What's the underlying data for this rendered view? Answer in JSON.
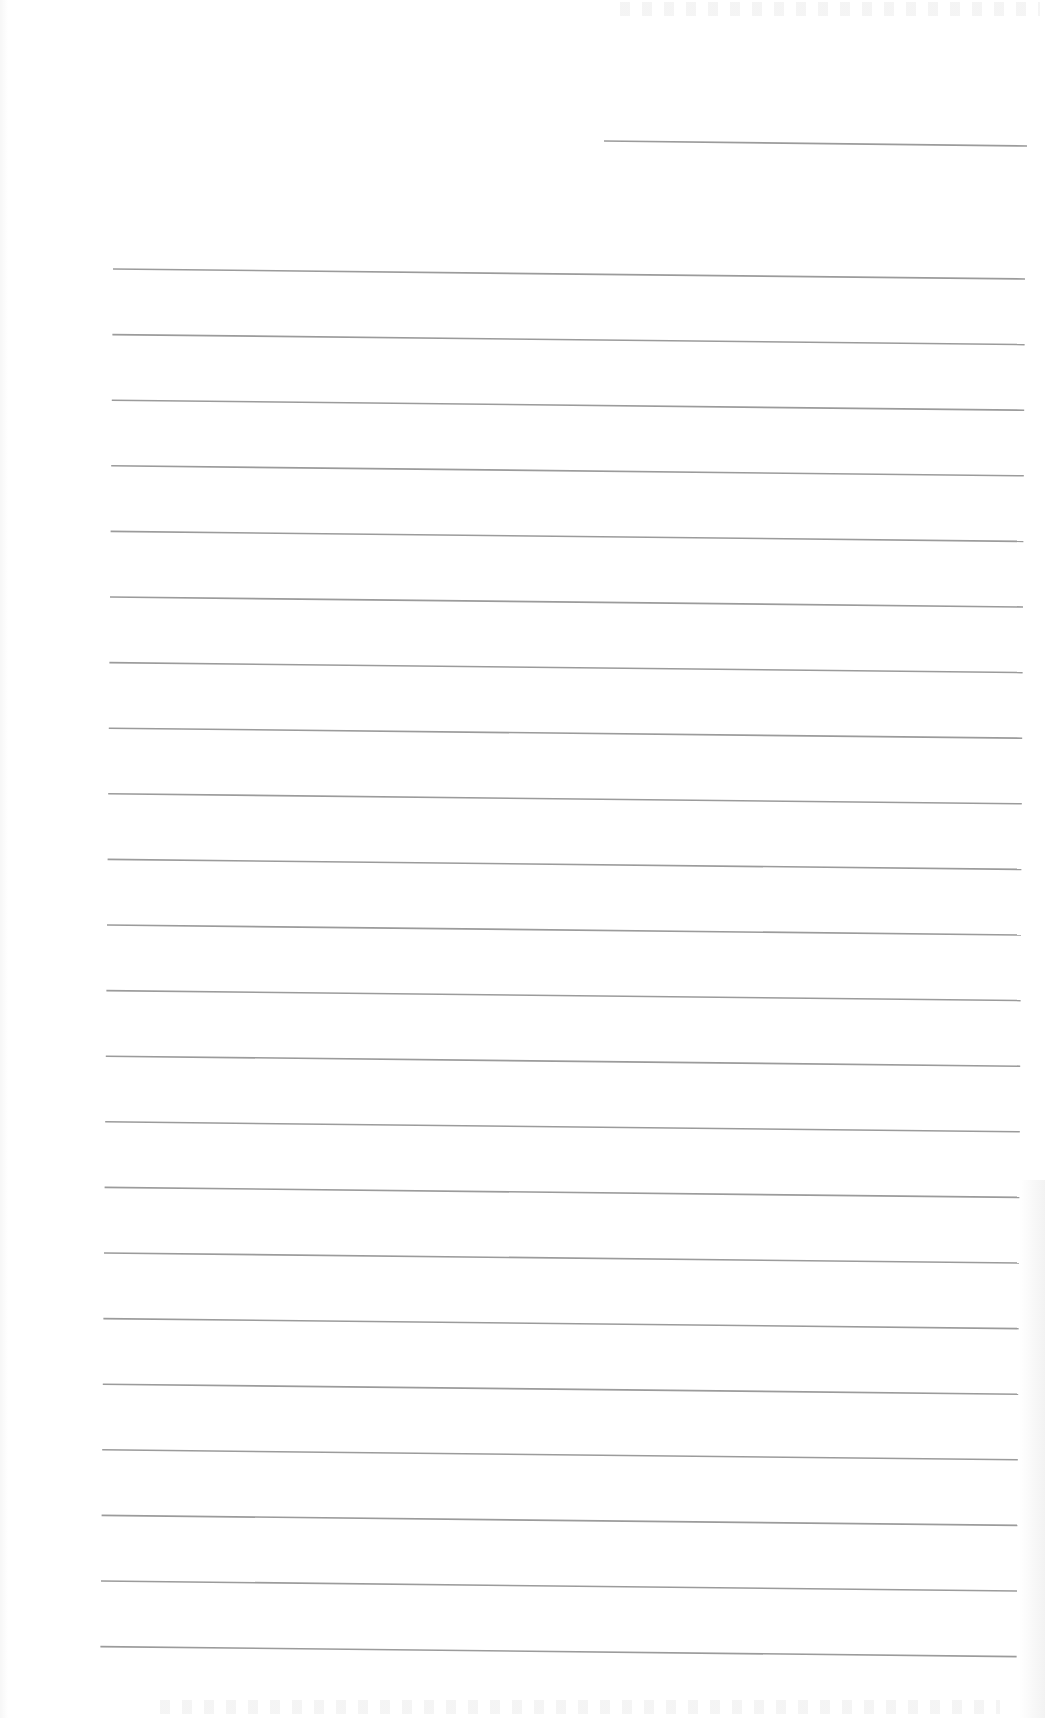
{
  "page": {
    "type": "blank-lined-paper",
    "width": 1045,
    "height": 1718,
    "paper_color": "#ffffff",
    "line_color": "#9b9b9b",
    "line_thickness": 1.6
  },
  "header_line": {
    "x1": 604,
    "y1": 141,
    "x2": 1027,
    "y2": 146
  },
  "ruled_lines": {
    "count": 22,
    "first": {
      "x1": 113,
      "y1": 269,
      "x2": 1025,
      "y2": 279
    },
    "spacing": 65.6,
    "left_x_drift_per_line": -0.6,
    "right_x_drift_per_line": -0.4
  },
  "content": {
    "text": []
  }
}
